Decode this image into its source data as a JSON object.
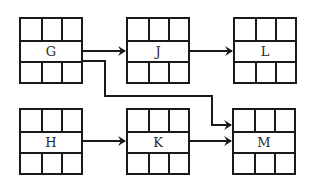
{
  "diagram": {
    "type": "linked-record-graph",
    "colors": {
      "line": "#1a1a1a",
      "text": "#2a2a2a",
      "background": "#ffffff"
    },
    "nodes": [
      {
        "id": "G",
        "label": "G",
        "x": 19,
        "y": 17
      },
      {
        "id": "J",
        "label": "J",
        "x": 126,
        "y": 17
      },
      {
        "id": "L",
        "label": "L",
        "x": 233,
        "y": 17
      },
      {
        "id": "H",
        "label": "H",
        "x": 19,
        "y": 108
      },
      {
        "id": "K",
        "label": "K",
        "x": 126,
        "y": 108
      },
      {
        "id": "M",
        "label": "M",
        "x": 232,
        "y": 108
      }
    ],
    "edges": [
      {
        "from": "G",
        "to": "J"
      },
      {
        "from": "J",
        "to": "L"
      },
      {
        "from": "G",
        "to": "M"
      },
      {
        "from": "H",
        "to": "K"
      },
      {
        "from": "K",
        "to": "M"
      }
    ]
  }
}
